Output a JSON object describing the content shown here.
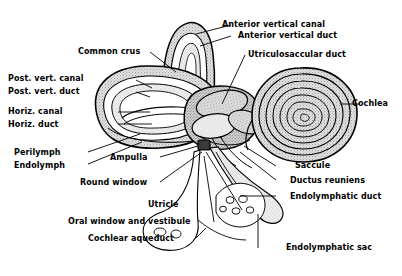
{
  "figure": {
    "background_color": "#ffffff",
    "ink_color": "#000000",
    "fill_light_gray": "#d9d9d9",
    "fill_mid_gray": "#bdbdbd",
    "fill_dark": "#3a3a3a"
  },
  "labels": {
    "anterior_vertical_canal": "Anterior vertical canal",
    "anterior_vertical_duct": "Anterior vertical duct",
    "utriculosaccular_duct": "Utriculosaccular duct",
    "common_crus": "Common crus",
    "post_vert_canal": "Post. vert. canal",
    "post_vert_duct": "Post. vert. duct",
    "horiz_canal": "Horiz. canal",
    "horiz_duct": "Horiz. duct",
    "perilymph": "Perilymph",
    "endolymph": "Endolymph",
    "ampulla": "Ampulla",
    "round_window": "Round window",
    "oral_window_and_vestibule": "Oral window and vestibule",
    "cochlear_aqueduct": "Cochlear aqueduct",
    "utricle": "Utricle",
    "cochlea": "Cochlea",
    "saccule": "Saccule",
    "ductus_reuniens": "Ductus reuniens",
    "endolymphatic_duct": "Endolymphatic duct",
    "endolymphatic_sac": "Endolymphatic sac"
  }
}
